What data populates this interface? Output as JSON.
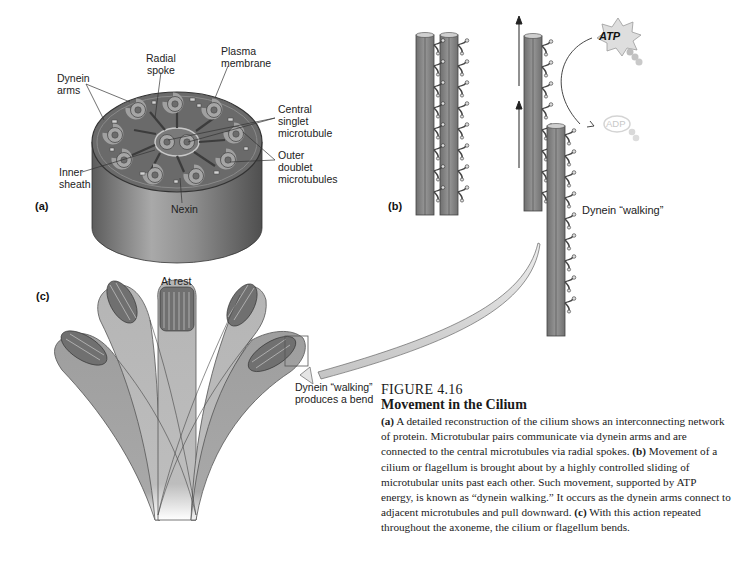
{
  "figure": {
    "number": "FIGURE 4.16",
    "title": "Movement in the Cilium",
    "caption_parts": [
      {
        "tag": "(a)",
        "text": " A detailed reconstruction of the cilium shows an interconnecting network of protein. Microtubular pairs communicate via dynein arms and are connected to the central microtubules via radial spokes. "
      },
      {
        "tag": "(b)",
        "text": " Movement of a cilium or flagellum is brought about by a highly controlled sliding of microtubular units past each other. Such movement, supported by ATP energy, is known as “dynein walking.” It occurs as the dynein arms connect to adjacent microtubules and pull downward. "
      },
      {
        "tag": "(c)",
        "text": " With this action repeated throughout the axoneme, the cilium or flagellum bends."
      }
    ]
  },
  "panel_a": {
    "tag": "(a)",
    "labels": {
      "dynein_arms": "Dynein\narms",
      "radial_spoke": "Radial\nspoke",
      "plasma_membrane": "Plasma\nmembrane",
      "central_singlet": "Central\nsinglet\nmicrotubule",
      "outer_doublet": "Outer\ndoublet\nmicrotubules",
      "inner_sheath": "Inner\nsheath",
      "nexin": "Nexin"
    }
  },
  "panel_b": {
    "tag": "(b)",
    "atp_label": "ATP",
    "adp_label": "ADP",
    "dynein_walking": "Dynein “walking”"
  },
  "panel_c": {
    "tag": "(c)",
    "at_rest": "At rest",
    "bend_label": "Dynein “walking”\nproduces a bend"
  },
  "colors": {
    "tube_fill": "#8c8c8c",
    "tube_dark": "#5e5e5e",
    "cylinder_top": "#6e6e6e",
    "ring": "#a8a8a8",
    "cilium_fill": "#b9b9b9",
    "atp_burst": "#d9d9d9",
    "adp_faint": "#e2e2e2",
    "curved_arrow": "#cfcfcf"
  }
}
